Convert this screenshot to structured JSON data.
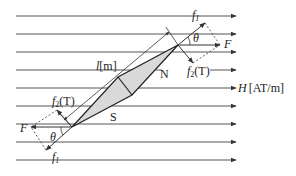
{
  "diagram": {
    "field_label": "H [AT/m]",
    "field_symbol": "H",
    "field_unit": "[AT/m]",
    "length_label": "l [m]",
    "length_symbol": "l",
    "length_unit": "[m]",
    "north_pole": "N",
    "south_pole": "S",
    "force_total": "F",
    "force_component_1": "f",
    "force_component_1_sub": "1",
    "force_component_2": "f",
    "force_component_2_sub": "2",
    "force_component_2_unit": "(T)",
    "angle": "θ",
    "field_lines_count": 9,
    "colors": {
      "line": "#333333",
      "needle_fill": "#d9d9d9",
      "text": "#222222"
    }
  }
}
